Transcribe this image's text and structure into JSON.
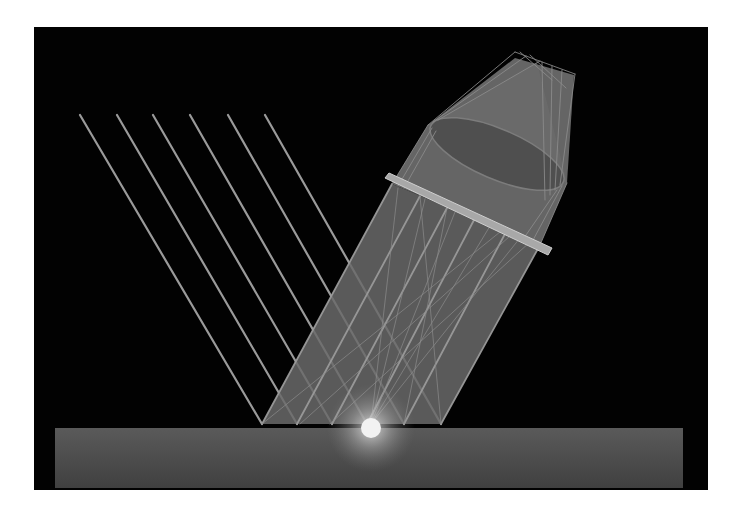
{
  "diagram": {
    "title": "",
    "type": "optical-ray-diagram",
    "canvas": {
      "width": 740,
      "height": 519,
      "page_bg": "#ffffff"
    },
    "panel": {
      "x": 34,
      "y": 27,
      "w": 674,
      "h": 463,
      "fill": "#020202"
    },
    "colors": {
      "ray": "#9a9a9a",
      "ray_thin": "#8c8c8c",
      "beam_fill": "#6a6a6a",
      "beam_fill_dark": "#4e4e4e",
      "objective_fill": "#6e6e6e",
      "lens_fill": "#4f4f4f",
      "lens_stroke": "#7c7c7c",
      "plate_fill": "#a8a8a8",
      "plate_stroke": "#cfcfcf",
      "ground_top": "#5a5a5a",
      "ground_bottom": "#404040",
      "glow_core": "#f2f2f2",
      "glow_halo": "#d8d8d8"
    },
    "ground": {
      "x": 55,
      "y": 428,
      "w": 628,
      "h": 60
    },
    "specimen_spot": {
      "cx": 371,
      "cy": 428,
      "r": 10,
      "halo_r": 44
    },
    "incident_rays": [
      {
        "x1": 80,
        "y1": 115,
        "x2": 262,
        "y2": 424
      },
      {
        "x1": 117,
        "y1": 115,
        "x2": 297,
        "y2": 424
      },
      {
        "x1": 153,
        "y1": 115,
        "x2": 332,
        "y2": 424
      },
      {
        "x1": 190,
        "y1": 115,
        "x2": 367,
        "y2": 424
      },
      {
        "x1": 228,
        "y1": 115,
        "x2": 404,
        "y2": 424
      },
      {
        "x1": 265,
        "y1": 115,
        "x2": 441,
        "y2": 424
      }
    ],
    "reflected_beam": {
      "polygon": "262,424 297,424 332,424 367,424 404,424 441,424 540,245 392,184"
    },
    "reflected_rays": [
      {
        "x1": 262,
        "y1": 424,
        "x2": 392,
        "y2": 184
      },
      {
        "x1": 297,
        "y1": 424,
        "x2": 420,
        "y2": 196
      },
      {
        "x1": 332,
        "y1": 424,
        "x2": 447,
        "y2": 208
      },
      {
        "x1": 367,
        "y1": 424,
        "x2": 474,
        "y2": 220
      },
      {
        "x1": 404,
        "y1": 424,
        "x2": 506,
        "y2": 232
      },
      {
        "x1": 441,
        "y1": 424,
        "x2": 540,
        "y2": 245
      }
    ],
    "scatter_rays": [
      {
        "x1": 371,
        "y1": 424,
        "x2": 520,
        "y2": 238
      },
      {
        "x1": 371,
        "y1": 424,
        "x2": 490,
        "y2": 226
      },
      {
        "x1": 371,
        "y1": 424,
        "x2": 455,
        "y2": 212
      },
      {
        "x1": 371,
        "y1": 424,
        "x2": 425,
        "y2": 199
      },
      {
        "x1": 371,
        "y1": 424,
        "x2": 398,
        "y2": 188
      },
      {
        "x1": 300,
        "y1": 424,
        "x2": 510,
        "y2": 236
      },
      {
        "x1": 330,
        "y1": 424,
        "x2": 530,
        "y2": 242
      },
      {
        "x1": 262,
        "y1": 424,
        "x2": 500,
        "y2": 232
      },
      {
        "x1": 441,
        "y1": 424,
        "x2": 420,
        "y2": 196
      },
      {
        "x1": 404,
        "y1": 424,
        "x2": 447,
        "y2": 208
      }
    ],
    "cover_plate": {
      "points": "385,178 389,173 552,248 548,255"
    },
    "objective_body": {
      "polygon": "392,184 428,125 515,58 574,75 567,183 540,245"
    },
    "objective_cone": {
      "polygon": "428,125 537,63 567,183"
    },
    "lens": {
      "cx": 497,
      "cy": 154,
      "rx": 72,
      "ry": 25,
      "rotate": 23
    },
    "upper_rays": [
      {
        "x1": 428,
        "y1": 125,
        "x2": 515,
        "y2": 52
      },
      {
        "x1": 433,
        "y1": 122,
        "x2": 526,
        "y2": 56
      },
      {
        "x1": 438,
        "y1": 120,
        "x2": 540,
        "y2": 61
      },
      {
        "x1": 515,
        "y1": 52,
        "x2": 575,
        "y2": 74
      },
      {
        "x1": 560,
        "y1": 185,
        "x2": 575,
        "y2": 74
      },
      {
        "x1": 555,
        "y1": 190,
        "x2": 562,
        "y2": 70
      },
      {
        "x1": 550,
        "y1": 195,
        "x2": 552,
        "y2": 66
      },
      {
        "x1": 545,
        "y1": 200,
        "x2": 542,
        "y2": 62
      },
      {
        "x1": 392,
        "y1": 184,
        "x2": 428,
        "y2": 125
      },
      {
        "x1": 398,
        "y1": 186,
        "x2": 432,
        "y2": 128
      },
      {
        "x1": 404,
        "y1": 188,
        "x2": 436,
        "y2": 131
      },
      {
        "x1": 540,
        "y1": 245,
        "x2": 567,
        "y2": 183
      },
      {
        "x1": 532,
        "y1": 242,
        "x2": 562,
        "y2": 186
      },
      {
        "x1": 524,
        "y1": 238,
        "x2": 557,
        "y2": 190
      },
      {
        "x1": 520,
        "y1": 52,
        "x2": 552,
        "y2": 80
      },
      {
        "x1": 530,
        "y1": 55,
        "x2": 566,
        "y2": 88
      }
    ]
  }
}
